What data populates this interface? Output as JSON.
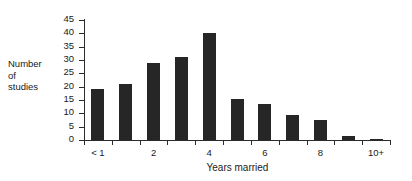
{
  "chart_data": {
    "type": "bar",
    "title": "",
    "xlabel": "Years married",
    "ylabel": "Number of studies",
    "ylabel_lines": [
      "Number",
      "of",
      "studies"
    ],
    "categories": [
      "< 1",
      "1",
      "2",
      "3",
      "4",
      "5",
      "6",
      "7",
      "8",
      "9",
      "10+"
    ],
    "tick_labels": [
      "< 1",
      "",
      "2",
      "",
      "4",
      "",
      "6",
      "",
      "8",
      "",
      "10+"
    ],
    "values": [
      19,
      21,
      29,
      31,
      40,
      15.5,
      13.5,
      9.5,
      7.5,
      1.5,
      0.5
    ],
    "ylim": [
      0,
      45
    ],
    "y_ticks": [
      0,
      5,
      10,
      15,
      20,
      25,
      30,
      35,
      40,
      45
    ],
    "y_tick_labels": [
      "0",
      "5",
      "10",
      "15",
      "20",
      "25",
      "30",
      "35",
      "40",
      "45"
    ],
    "grid": false,
    "legend": "none",
    "bar_color": "#262626",
    "axis_color": "#2b2b2b",
    "background_color": "#ffffff"
  }
}
